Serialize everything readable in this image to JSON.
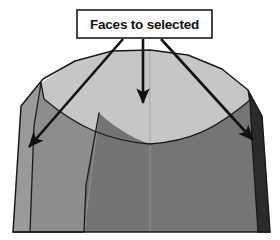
{
  "figure": {
    "name": "3d-dome-solid-annotated-diagram",
    "background_color": "#ffffff",
    "callout": {
      "label": "Faces to selected",
      "box_fill": "#ffffff",
      "box_stroke": "#1a1a1a",
      "text_color": "#111111"
    },
    "annotations": {
      "arrow_color": "#111111",
      "arrow_count": 3,
      "arrows": [
        {
          "name": "arrow-to-left-face",
          "target": "left side face"
        },
        {
          "name": "arrow-to-top-face",
          "target": "top dome face"
        },
        {
          "name": "arrow-to-right-face",
          "target": "right side face"
        }
      ]
    },
    "solid": {
      "name": "extruded-arch-solid",
      "outline_color": "#1a1a1a",
      "faces": [
        {
          "name": "top-dome-face",
          "color": "#c6c6c6"
        },
        {
          "name": "front-lower-face",
          "color": "#757575"
        },
        {
          "name": "left-side-face",
          "color": "#8d8d8d"
        },
        {
          "name": "right-side-face",
          "color": "#6e6e6e"
        },
        {
          "name": "right-dark-edge-face",
          "color": "#2b2b2b"
        },
        {
          "name": "left-narrow-edge-face",
          "color": "#9a9a9a"
        }
      ],
      "seam_color": "#9b9b9b"
    }
  }
}
